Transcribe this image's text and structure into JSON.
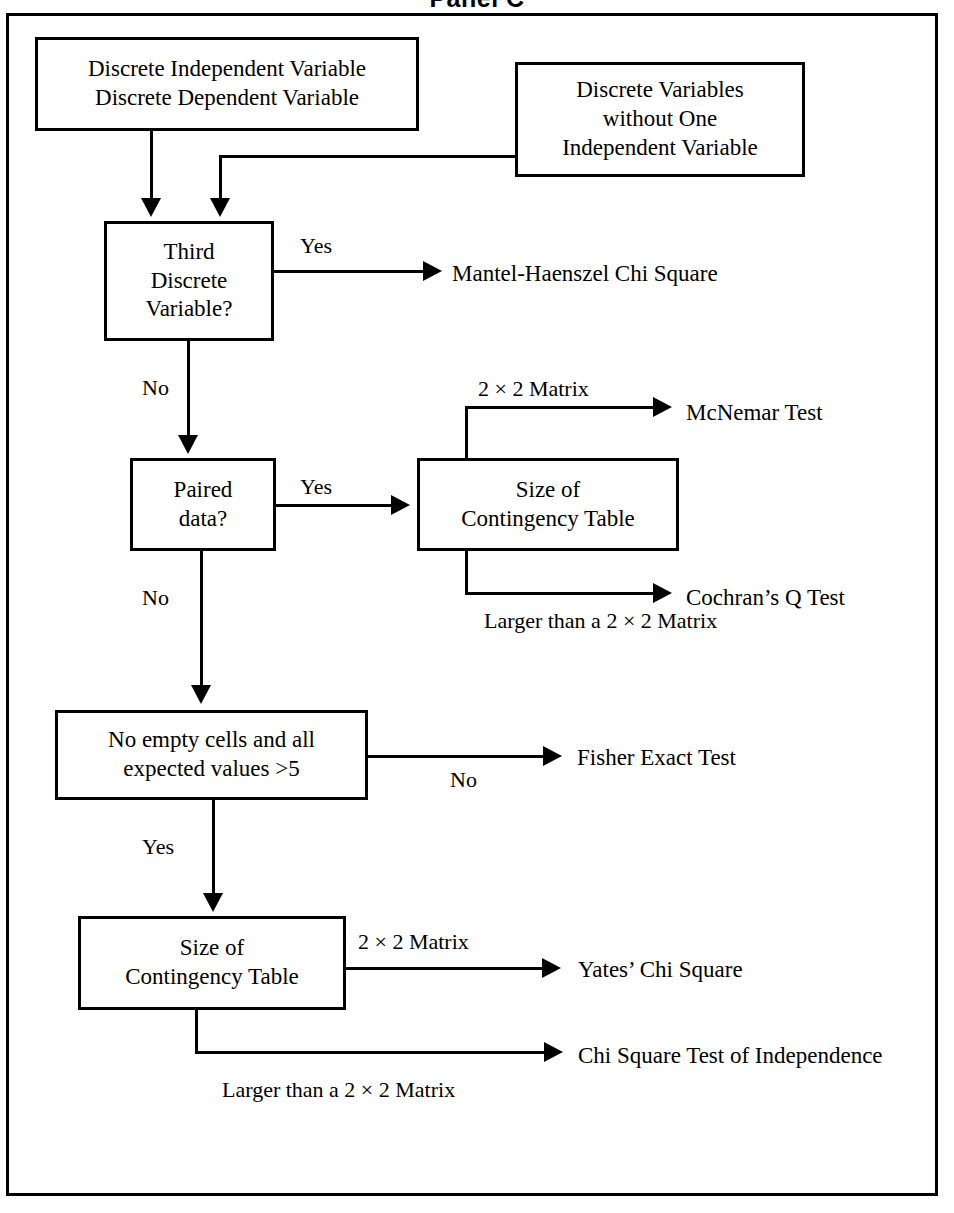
{
  "panel": {
    "title": "Panel C"
  },
  "nodes": {
    "discrete_iv_dv": {
      "line1": "Discrete Independent Variable",
      "line2": "Discrete Dependent Variable"
    },
    "discrete_no_iv": {
      "line1": "Discrete Variables",
      "line2": "without One",
      "line3": "Independent Variable"
    },
    "third_discrete": {
      "line1": "Third",
      "line2": "Discrete",
      "line3": "Variable?"
    },
    "paired_data": {
      "line1": "Paired",
      "line2": "data?"
    },
    "size_contingency_paired": {
      "line1": "Size of",
      "line2": "Contingency Table"
    },
    "no_empty_cells": {
      "line1": "No empty cells and all",
      "line2": "expected values >5"
    },
    "size_contingency_unpaired": {
      "line1": "Size of",
      "line2": "Contingency Table"
    }
  },
  "terminals": {
    "mantel_haenszel": "Mantel-Haenszel Chi Square",
    "mcnemar": "McNemar Test",
    "cochran_q": "Cochran’s Q Test",
    "fisher_exact": "Fisher Exact Test",
    "yates_chi_square": "Yates’ Chi Square",
    "chi_square_independence_line1": "Chi Square",
    "chi_square_independence_line2": "Test of Independence"
  },
  "edge_labels": {
    "third_discrete_yes": "Yes",
    "third_discrete_no": "No",
    "paired_yes": "Yes",
    "paired_no": "No",
    "matrix_2x2_top": "2 × 2 Matrix",
    "larger_than_2x2_line1": "Larger than a",
    "larger_than_2x2_line2": "2 × 2 Matrix",
    "no_empty_cells_no": "No",
    "no_empty_cells_yes": "Yes",
    "matrix_2x2_bottom": "2 × 2 Matrix",
    "larger_than_2x2_bottom": "Larger than a 2 × 2 Matrix"
  },
  "colors": {
    "ink": "#000000",
    "paper": "#ffffff"
  }
}
